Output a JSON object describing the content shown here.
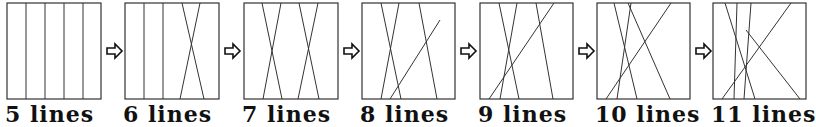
{
  "diagram": {
    "arrow_icon": "hollow-right-arrow",
    "stroke_color": "#333333",
    "panels": [
      {
        "label": "5 lines",
        "lines": [
          [
            26,
            3,
            26,
            99
          ],
          [
            45,
            3,
            45,
            99
          ],
          [
            64,
            3,
            64,
            99
          ],
          [
            83,
            3,
            83,
            99
          ]
        ]
      },
      {
        "label": "6 lines",
        "lines": [
          [
            144,
            3,
            144,
            99
          ],
          [
            163,
            3,
            163,
            99
          ],
          [
            182,
            3,
            204,
            99
          ],
          [
            200,
            3,
            180,
            99
          ]
        ]
      },
      {
        "label": "7 lines",
        "lines": [
          [
            262,
            3,
            282,
            99
          ],
          [
            281,
            3,
            263,
            99
          ],
          [
            299,
            3,
            319,
            99
          ],
          [
            318,
            3,
            298,
            99
          ]
        ]
      },
      {
        "label": "8 lines",
        "lines": [
          [
            381,
            3,
            401,
            99
          ],
          [
            399,
            3,
            381,
            99
          ],
          [
            419,
            3,
            437,
            99
          ],
          [
            440,
            20,
            390,
            99
          ]
        ]
      },
      {
        "label": "9 lines",
        "lines": [
          [
            499,
            3,
            519,
            99
          ],
          [
            517,
            3,
            500,
            99
          ],
          [
            536,
            3,
            553,
            99
          ],
          [
            554,
            3,
            489,
            99
          ]
        ]
      },
      {
        "label": "10 lines",
        "lines": [
          [
            614,
            3,
            637,
            99
          ],
          [
            631,
            3,
            617,
            99
          ],
          [
            628,
            3,
            670,
            99
          ],
          [
            671,
            3,
            606,
            99
          ]
        ]
      },
      {
        "label": "11 lines",
        "lines": [
          [
            725,
            3,
            755,
            99
          ],
          [
            737,
            3,
            734,
            99
          ],
          [
            751,
            3,
            744,
            99
          ],
          [
            791,
            3,
            722,
            99
          ],
          [
            746,
            30,
            800,
            99
          ]
        ]
      }
    ]
  }
}
